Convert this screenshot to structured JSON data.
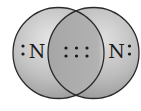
{
  "diagram": {
    "type": "lewis-structure-overlap",
    "molecule": "N2",
    "atoms": [
      {
        "symbol": "N",
        "position": "left",
        "lone_pair_side": "left",
        "lone_pair_electrons": 2
      },
      {
        "symbol": "N",
        "position": "right",
        "lone_pair_side": "right",
        "lone_pair_electrons": 2
      }
    ],
    "shared_electrons": 6,
    "shared_layout": {
      "rows": 2,
      "columns": 3
    },
    "bond": "triple",
    "colors": {
      "circle_light": "#e2e2e2",
      "circle_dark": "#9c9c9c",
      "overlap": "#b0b0b0",
      "outline": "#2a2a2a",
      "electron": "#1a1a1a"
    }
  }
}
